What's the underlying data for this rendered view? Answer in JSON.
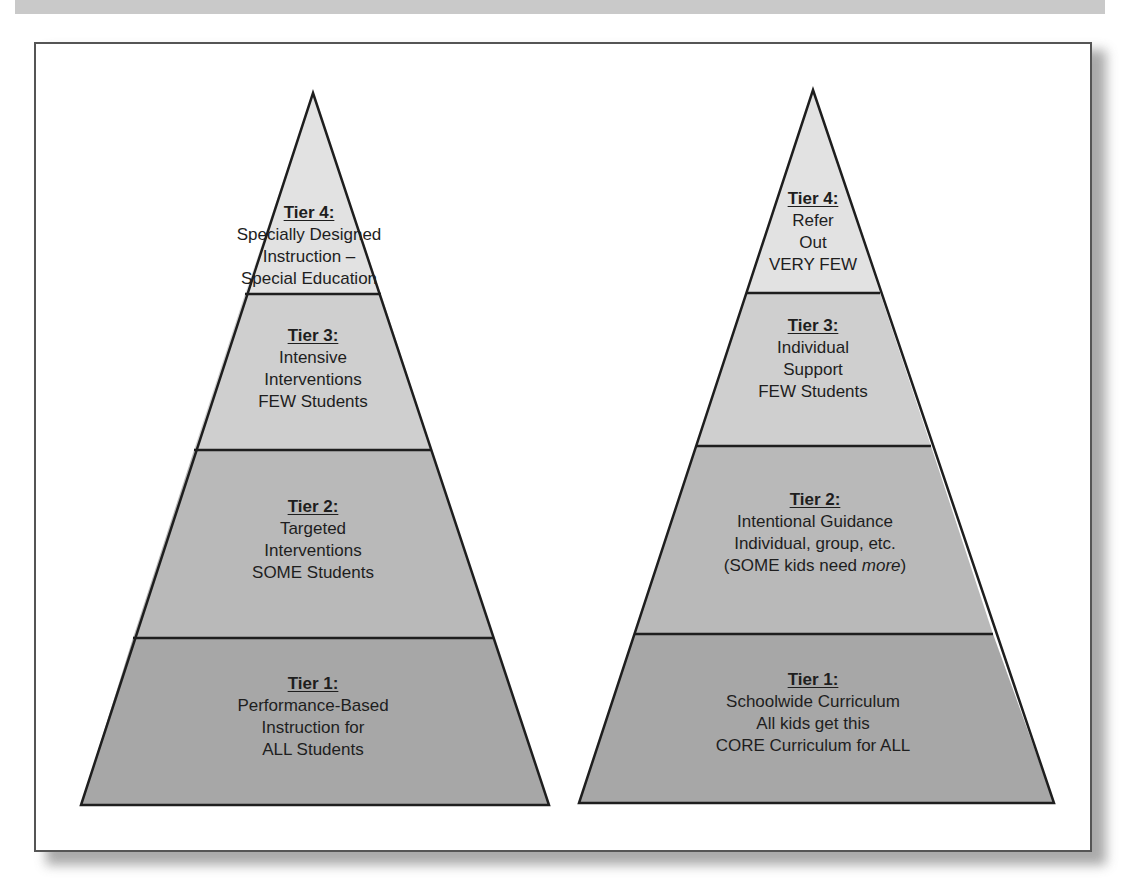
{
  "colors": {
    "frame_border": "#555555",
    "outline": "#1e1e1e",
    "tier4_fill": "#e2e2e2",
    "tier3_fill": "#cfcfcf",
    "tier2_fill": "#b9b9b9",
    "tier1_fill": "#a7a7a7",
    "text": "#1e1e1e"
  },
  "left_pyramid": {
    "tiers": [
      {
        "title": "Tier 4:",
        "lines": [
          "Specially Designed",
          "Instruction –",
          "Special Education"
        ]
      },
      {
        "title": "Tier 3:",
        "lines": [
          "Intensive",
          "Interventions",
          "FEW Students"
        ]
      },
      {
        "title": "Tier 2:",
        "lines": [
          "Targeted",
          "Interventions",
          "SOME Students"
        ]
      },
      {
        "title": "Tier 1:",
        "lines": [
          "Performance-Based",
          "Instruction for",
          "ALL Students"
        ]
      }
    ]
  },
  "right_pyramid": {
    "tiers": [
      {
        "title": "Tier 4:",
        "lines": [
          "Refer",
          "Out",
          "VERY FEW"
        ]
      },
      {
        "title": "Tier 3:",
        "lines": [
          "Individual",
          "Support",
          "FEW Students"
        ]
      },
      {
        "title": "Tier 2:",
        "lines": [
          "Intentional Guidance",
          "Individual, group, etc."
        ],
        "last_line_prefix": "(SOME kids need ",
        "last_line_emphasis": "more",
        "last_line_suffix": ")"
      },
      {
        "title": "Tier 1:",
        "lines": [
          "Schoolwide Curriculum",
          "All kids get this",
          "CORE Curriculum for ALL"
        ]
      }
    ]
  }
}
